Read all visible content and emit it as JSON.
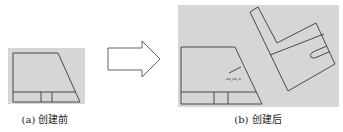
{
  "panels": [
    {
      "id": "a",
      "caption": "(a) 创建前"
    },
    {
      "id": "b",
      "caption": "(b) 创建后"
    }
  ],
  "annotation_text": "aa_aa_a",
  "colors": {
    "panel_bg": "#d6d6d6",
    "line": "#3a3a3a",
    "arrow_fill": "#ffffff",
    "caption": "#222222"
  },
  "arrow": {
    "direction": "right"
  }
}
